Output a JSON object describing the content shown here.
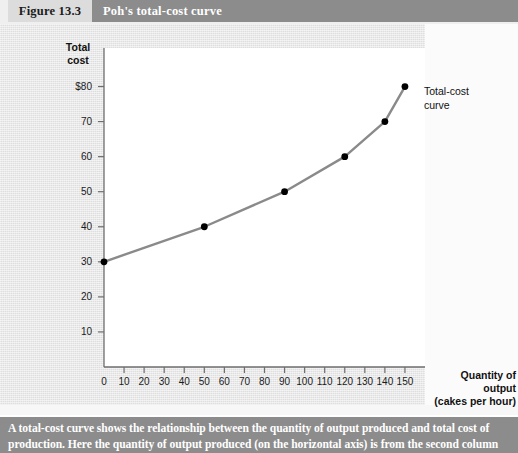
{
  "header": {
    "figure_number": "Figure 13.3",
    "figure_title": "Poh's total-cost curve"
  },
  "caption": {
    "text": "A total-cost curve shows the relationship between the quantity of output produced and total cost of production. Here the quantity of output produced (on the horizontal axis) is from the second column"
  },
  "annotations": {
    "curve_label": "Total-cost\ncurve"
  },
  "colors": {
    "header_number_bg": "#dcdcdc",
    "header_title_bg": "#8c8c8c",
    "body_bg": "#e4e4e4",
    "plot_bg": "#ffffff",
    "curve": "#8a8a8a",
    "point": "#000000",
    "axis": "#6e6e6e",
    "caption_bg": "#8c8c8c",
    "text": "#111111"
  },
  "chart_data": {
    "type": "line",
    "title": "Poh's total-cost curve",
    "xlabel": "Quantity of output\n(cakes per hour)",
    "ylabel": "Total\ncost",
    "xlim": [
      0,
      160
    ],
    "ylim": [
      0,
      85
    ],
    "grid": false,
    "legend": "none",
    "x_ticks": [
      0,
      10,
      20,
      30,
      40,
      50,
      60,
      70,
      80,
      90,
      100,
      110,
      120,
      130,
      140,
      150
    ],
    "x_tick_labels": [
      "0",
      "10",
      "20",
      "30",
      "40",
      "50",
      "60",
      "70",
      "80",
      "90",
      "100",
      "110",
      "120",
      "130",
      "140",
      "150"
    ],
    "y_ticks": [
      10,
      20,
      30,
      40,
      50,
      60,
      70,
      80
    ],
    "y_tick_labels": [
      "10",
      "20",
      "30",
      "40",
      "50",
      "60",
      "70",
      "$80"
    ],
    "series": [
      {
        "name": "Total-cost curve",
        "points": [
          {
            "x": 0,
            "y": 30
          },
          {
            "x": 50,
            "y": 40
          },
          {
            "x": 90,
            "y": 50
          },
          {
            "x": 120,
            "y": 60
          },
          {
            "x": 140,
            "y": 70
          },
          {
            "x": 150,
            "y": 80
          }
        ]
      }
    ]
  }
}
